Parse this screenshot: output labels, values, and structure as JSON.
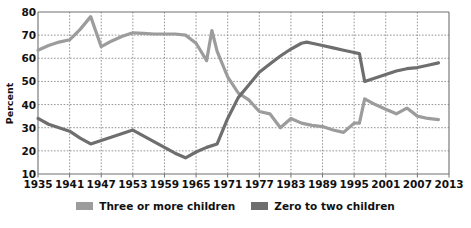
{
  "chart_data": {
    "type": "line",
    "title": "",
    "xlabel": "",
    "ylabel": "Percent",
    "ylim": [
      10,
      80
    ],
    "ytick_values": [
      80,
      70,
      60,
      50,
      40,
      30,
      20,
      10
    ],
    "xlim": [
      1935,
      2013
    ],
    "xtick_values": [
      1935,
      1941,
      1947,
      1953,
      1959,
      1965,
      1971,
      1977,
      1983,
      1989,
      1995,
      2001,
      2007,
      2013
    ],
    "grid": true,
    "legend_position": "bottom-center",
    "series": [
      {
        "name": "Three or more children",
        "color": "#9c9c9c",
        "x": [
          1935,
          1937,
          1939,
          1941,
          1943,
          1945,
          1947,
          1949,
          1951,
          1953,
          1955,
          1957,
          1959,
          1961,
          1963,
          1965,
          1967,
          1968,
          1969,
          1971,
          1973,
          1975,
          1977,
          1979,
          1981,
          1983,
          1985,
          1987,
          1989,
          1991,
          1993,
          1995,
          1996,
          1997,
          1999,
          2001,
          2003,
          2005,
          2007,
          2009,
          2011
        ],
        "values": [
          63.5,
          65.5,
          67.0,
          68.0,
          72.5,
          78.0,
          65.0,
          67.5,
          69.5,
          71.0,
          70.8,
          70.5,
          70.5,
          70.5,
          70.0,
          66.5,
          59.0,
          72.0,
          63.0,
          52.0,
          45.0,
          42.0,
          37.0,
          36.0,
          30.0,
          34.0,
          32.0,
          31.0,
          30.5,
          29.0,
          28.0,
          32.0,
          32.0,
          42.5,
          40.0,
          38.0,
          36.0,
          38.5,
          35.0,
          34.0,
          33.5
        ]
      },
      {
        "name": "Zero to two children",
        "color": "#6e6e6e",
        "x": [
          1935,
          1937,
          1939,
          1941,
          1943,
          1945,
          1947,
          1949,
          1951,
          1953,
          1955,
          1957,
          1959,
          1961,
          1963,
          1965,
          1967,
          1969,
          1971,
          1973,
          1975,
          1977,
          1979,
          1981,
          1983,
          1985,
          1986,
          1987,
          1989,
          1991,
          1993,
          1995,
          1996,
          1997,
          1999,
          2001,
          2003,
          2005,
          2007,
          2009,
          2011
        ],
        "values": [
          34.0,
          31.5,
          30.0,
          28.5,
          25.5,
          23.0,
          24.5,
          26.0,
          27.5,
          29.0,
          26.5,
          24.0,
          21.5,
          19.0,
          17.0,
          19.5,
          21.5,
          23.0,
          34.0,
          43.0,
          48.5,
          54.0,
          57.5,
          61.0,
          64.0,
          66.5,
          67.0,
          66.5,
          65.5,
          64.5,
          63.5,
          62.5,
          62.0,
          50.0,
          51.5,
          53.0,
          54.5,
          55.5,
          56.0,
          57.0,
          58.0
        ]
      }
    ],
    "annotations": {
      "crossover_year": 1972,
      "crossover_value": 42
    }
  },
  "axes": {
    "y_title": "Percent",
    "y_ticks": [
      "80",
      "70",
      "60",
      "50",
      "40",
      "30",
      "20",
      "10"
    ],
    "x_ticks": [
      "1935",
      "1941",
      "1947",
      "1953",
      "1959",
      "1965",
      "1971",
      "1977",
      "1983",
      "1989",
      "1995",
      "2001",
      "2007",
      "2013"
    ]
  },
  "legend": {
    "items": [
      {
        "label": "Three or more children",
        "color": "#9c9c9c"
      },
      {
        "label": "Zero to two children",
        "color": "#6e6e6e"
      }
    ]
  },
  "colors": {
    "series_light": "#9c9c9c",
    "series_dark": "#6e6e6e",
    "grid": "#8a8a8a",
    "axis": "#6f6f6f",
    "text": "#111111",
    "background": "#ffffff"
  }
}
